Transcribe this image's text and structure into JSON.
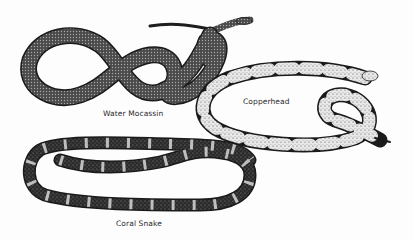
{
  "illustration": {
    "style": "black-and-white stippled field-guide drawing",
    "background": "#fdfdfd",
    "ink": "#1a1a1a",
    "snakes": [
      {
        "name": "water-moccasin",
        "label": "Water Mocassin",
        "pattern": "mottled dark with lighter blotches"
      },
      {
        "name": "copperhead",
        "label": "Copperhead",
        "pattern": "light body with dark hourglass bands"
      },
      {
        "name": "coral-snake",
        "label": "Coral Snake",
        "pattern": "dark body with light stippled rings"
      }
    ]
  }
}
